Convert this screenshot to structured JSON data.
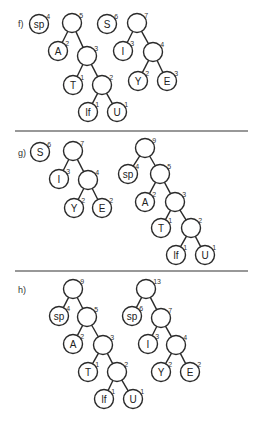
{
  "panels": [
    {
      "label": "f)",
      "label_pos": [
        18,
        27
      ],
      "nodes": [
        {
          "id": "f_sp",
          "text": "sp",
          "w": "4",
          "x": 39,
          "y": 24
        },
        {
          "id": "f_5",
          "text": "",
          "w": "5",
          "x": 72,
          "y": 23
        },
        {
          "id": "f_A",
          "text": "A",
          "w": "2",
          "x": 58,
          "y": 51
        },
        {
          "id": "f_3",
          "text": "",
          "w": "3",
          "x": 87,
          "y": 56
        },
        {
          "id": "f_T",
          "text": "T",
          "w": "1",
          "x": 73,
          "y": 85
        },
        {
          "id": "f_2",
          "text": "",
          "w": "2",
          "x": 102,
          "y": 85
        },
        {
          "id": "f_If",
          "text": "lf",
          "w": "1",
          "x": 88,
          "y": 112
        },
        {
          "id": "f_U",
          "text": "U",
          "w": "1",
          "x": 117,
          "y": 112
        },
        {
          "id": "f_S",
          "text": "S",
          "w": "6",
          "x": 107,
          "y": 24
        },
        {
          "id": "f_7",
          "text": "",
          "w": "7",
          "x": 137,
          "y": 23
        },
        {
          "id": "f_I",
          "text": "I",
          "w": "3",
          "x": 123,
          "y": 51
        },
        {
          "id": "f_4",
          "text": "",
          "w": "4",
          "x": 153,
          "y": 52
        },
        {
          "id": "f_Y",
          "text": "Y",
          "w": "2",
          "x": 138,
          "y": 81
        },
        {
          "id": "f_E",
          "text": "E",
          "w": "3",
          "x": 167,
          "y": 81
        }
      ],
      "edges": [
        [
          "f_5",
          "f_A"
        ],
        [
          "f_5",
          "f_3"
        ],
        [
          "f_3",
          "f_T"
        ],
        [
          "f_3",
          "f_2"
        ],
        [
          "f_2",
          "f_If"
        ],
        [
          "f_2",
          "f_U"
        ],
        [
          "f_7",
          "f_I"
        ],
        [
          "f_7",
          "f_4"
        ],
        [
          "f_4",
          "f_Y"
        ],
        [
          "f_4",
          "f_E"
        ]
      ]
    },
    {
      "label": "g)",
      "label_pos": [
        18,
        156
      ],
      "nodes": [
        {
          "id": "g_S",
          "text": "S",
          "w": "6",
          "x": 40,
          "y": 152
        },
        {
          "id": "g_7",
          "text": "",
          "w": "7",
          "x": 73,
          "y": 151
        },
        {
          "id": "g_I",
          "text": "I",
          "w": "3",
          "x": 59,
          "y": 179
        },
        {
          "id": "g_4",
          "text": "",
          "w": "4",
          "x": 88,
          "y": 180
        },
        {
          "id": "g_Y",
          "text": "Y",
          "w": "2",
          "x": 74,
          "y": 208
        },
        {
          "id": "g_E",
          "text": "E",
          "w": "2",
          "x": 102,
          "y": 208
        },
        {
          "id": "g_9",
          "text": "",
          "w": "9",
          "x": 145,
          "y": 148
        },
        {
          "id": "g_sp",
          "text": "sp",
          "w": "4",
          "x": 128,
          "y": 174
        },
        {
          "id": "g_5",
          "text": "",
          "w": "5",
          "x": 160,
          "y": 174
        },
        {
          "id": "g_A",
          "text": "A",
          "w": "2",
          "x": 145,
          "y": 202
        },
        {
          "id": "g_3",
          "text": "",
          "w": "3",
          "x": 175,
          "y": 202
        },
        {
          "id": "g_T",
          "text": "T",
          "w": "1",
          "x": 161,
          "y": 228
        },
        {
          "id": "g_2",
          "text": "",
          "w": "2",
          "x": 191,
          "y": 228
        },
        {
          "id": "g_If",
          "text": "lf",
          "w": "1",
          "x": 176,
          "y": 255
        },
        {
          "id": "g_U",
          "text": "U",
          "w": "1",
          "x": 205,
          "y": 255
        }
      ],
      "edges": [
        [
          "g_7",
          "g_I"
        ],
        [
          "g_7",
          "g_4"
        ],
        [
          "g_4",
          "g_Y"
        ],
        [
          "g_4",
          "g_E"
        ],
        [
          "g_9",
          "g_sp"
        ],
        [
          "g_9",
          "g_5"
        ],
        [
          "g_5",
          "g_A"
        ],
        [
          "g_5",
          "g_3"
        ],
        [
          "g_3",
          "g_T"
        ],
        [
          "g_3",
          "g_2"
        ],
        [
          "g_2",
          "g_If"
        ],
        [
          "g_2",
          "g_U"
        ]
      ]
    },
    {
      "label": "h)",
      "label_pos": [
        18,
        293
      ],
      "nodes": [
        {
          "id": "h_9",
          "text": "",
          "w": "9",
          "x": 73,
          "y": 289
        },
        {
          "id": "h_sp",
          "text": "sp",
          "w": "4",
          "x": 59,
          "y": 316
        },
        {
          "id": "h_5",
          "text": "",
          "w": "5",
          "x": 87,
          "y": 317
        },
        {
          "id": "h_A",
          "text": "A",
          "w": "2",
          "x": 73,
          "y": 344
        },
        {
          "id": "h_3",
          "text": "",
          "w": "3",
          "x": 103,
          "y": 345
        },
        {
          "id": "h_T",
          "text": "T",
          "w": "1",
          "x": 88,
          "y": 372
        },
        {
          "id": "h_2",
          "text": "",
          "w": "2",
          "x": 117,
          "y": 372
        },
        {
          "id": "h_If",
          "text": "lf",
          "w": "1",
          "x": 104,
          "y": 399
        },
        {
          "id": "h_U",
          "text": "U",
          "w": "1",
          "x": 133,
          "y": 399
        },
        {
          "id": "h_13",
          "text": "",
          "w": "13",
          "x": 146,
          "y": 289
        },
        {
          "id": "h_sp2",
          "text": "sp",
          "w": "6",
          "x": 132,
          "y": 316
        },
        {
          "id": "h_7",
          "text": "",
          "w": "7",
          "x": 161,
          "y": 318
        },
        {
          "id": "h_I",
          "text": "I",
          "w": "3",
          "x": 148,
          "y": 344
        },
        {
          "id": "h_4",
          "text": "",
          "w": "4",
          "x": 176,
          "y": 345
        },
        {
          "id": "h_Y",
          "text": "Y",
          "w": "2",
          "x": 161,
          "y": 372
        },
        {
          "id": "h_E",
          "text": "E",
          "w": "2",
          "x": 190,
          "y": 372
        }
      ],
      "edges": [
        [
          "h_9",
          "h_sp"
        ],
        [
          "h_9",
          "h_5"
        ],
        [
          "h_5",
          "h_A"
        ],
        [
          "h_5",
          "h_3"
        ],
        [
          "h_3",
          "h_T"
        ],
        [
          "h_3",
          "h_2"
        ],
        [
          "h_2",
          "h_If"
        ],
        [
          "h_2",
          "h_U"
        ],
        [
          "h_13",
          "h_sp2"
        ],
        [
          "h_13",
          "h_7"
        ],
        [
          "h_7",
          "h_I"
        ],
        [
          "h_7",
          "h_4"
        ],
        [
          "h_4",
          "h_Y"
        ],
        [
          "h_4",
          "h_E"
        ]
      ]
    }
  ],
  "dividers": [
    {
      "x1": 15,
      "x2": 248,
      "y": 131
    },
    {
      "x1": 15,
      "x2": 248,
      "y": 271
    }
  ],
  "style": {
    "stroke": "#2a2a2a",
    "node_radius": 9.5
  }
}
